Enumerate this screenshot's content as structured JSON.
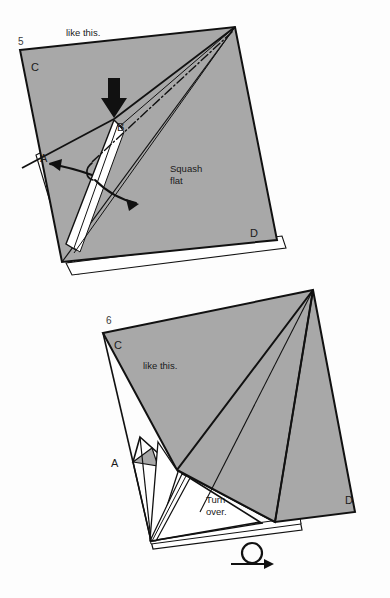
{
  "page": {
    "background_color": "#fdfdfd",
    "paper_fill": "#a8a8a8",
    "paper_back_fill": "#ffffff",
    "line_color": "#111111",
    "type": "origami-instruction-diagram",
    "width": 390,
    "height": 598
  },
  "steps": [
    {
      "number": "5",
      "caption_top": "like this.",
      "instruction": "Squash",
      "instruction_line2": "flat",
      "corner_labels": {
        "c": "C",
        "a": "A",
        "b": "B",
        "d": "D"
      },
      "symbols": {
        "push_arrow": "solid-black-push-arrow",
        "fold_line": "dash-dot-valley-fold-line",
        "open_arrows": "two-curved-open-arrows"
      }
    },
    {
      "number": "6",
      "caption_top": "like this.",
      "instruction": "Turn",
      "instruction_line2": "over.",
      "corner_labels": {
        "c": "C",
        "a": "A",
        "d": "D"
      },
      "symbols": {
        "turn_over": "turn-over-loop-arrow"
      }
    }
  ]
}
